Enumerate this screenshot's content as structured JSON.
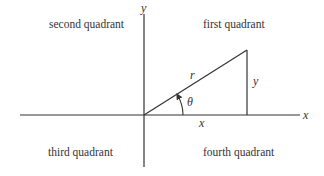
{
  "diagram": {
    "type": "coordinate-plane-quadrants",
    "axes": {
      "x_label": "x",
      "y_label": "y"
    },
    "quadrants": {
      "first": "first quadrant",
      "second": "second quadrant",
      "third": "third quadrant",
      "fourth": "fourth quadrant"
    },
    "triangle": {
      "hypotenuse_label": "r",
      "opposite_label": "y",
      "adjacent_label": "x",
      "angle_label": "θ"
    },
    "colors": {
      "stroke": "#333333",
      "background": "#ffffff"
    }
  }
}
